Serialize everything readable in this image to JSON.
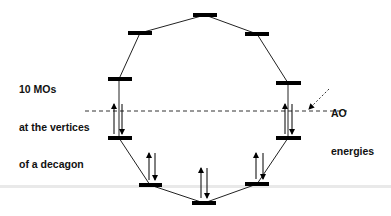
{
  "labels": {
    "mos_line1": "10 MOs",
    "mos_line2": "at the vertices",
    "mos_line3": "of a decagon",
    "ao_line1": "AO",
    "ao_line2": "energies"
  },
  "diagram": {
    "type": "molecular-orbital decagon (Frost circle)",
    "mo_count": 10,
    "levels": [
      {
        "id": "mo-top",
        "x": 205,
        "y": 15,
        "occupied": false
      },
      {
        "id": "mo-upper-left",
        "x": 140,
        "y": 33,
        "occupied": false
      },
      {
        "id": "mo-upper-right",
        "x": 257,
        "y": 34,
        "occupied": false
      },
      {
        "id": "mo-mid-upper-left",
        "x": 119,
        "y": 79,
        "occupied": false
      },
      {
        "id": "mo-mid-upper-right",
        "x": 288,
        "y": 83,
        "occupied": false
      },
      {
        "id": "mo-mid-lower-left",
        "x": 119,
        "y": 138,
        "occupied": true
      },
      {
        "id": "mo-mid-lower-right",
        "x": 288,
        "y": 138,
        "occupied": true
      },
      {
        "id": "mo-lower-left",
        "x": 150,
        "y": 185,
        "occupied": true
      },
      {
        "id": "mo-lower-right",
        "x": 257,
        "y": 184,
        "occupied": true
      },
      {
        "id": "mo-bottom",
        "x": 204,
        "y": 203,
        "occupied": true
      }
    ],
    "ao_energy_line_y": 111,
    "colors": {
      "line": "#000000",
      "band": "#e9e9e9"
    }
  }
}
